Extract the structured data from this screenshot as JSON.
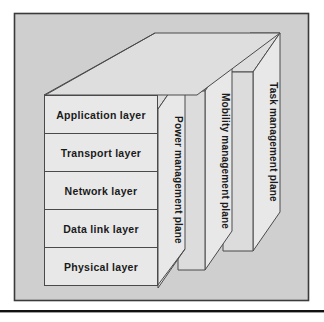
{
  "figure": {
    "type": "layered-3d-block-diagram",
    "background_color": "#ffffff",
    "panel_fill": "#cfcfcf",
    "panel_border_color": "#3b3b3b",
    "face_fill": "#e8e8e8",
    "top_fill": "#dedede",
    "side_fill": "#d9d9d9",
    "line_color": "#4a4a4a",
    "text_color": "#1a1a1a",
    "rule_color": "#111111"
  },
  "layers": [
    {
      "id": "application",
      "label": "Application layer"
    },
    {
      "id": "transport",
      "label": "Transport layer"
    },
    {
      "id": "network",
      "label": "Network layer"
    },
    {
      "id": "datalink",
      "label": "Data link layer"
    },
    {
      "id": "physical",
      "label": "Physical layer"
    }
  ],
  "planes": [
    {
      "id": "power",
      "label": "Power management plane"
    },
    {
      "id": "mobility",
      "label": "Mobility management plane"
    },
    {
      "id": "task",
      "label": "Task management plane"
    }
  ]
}
